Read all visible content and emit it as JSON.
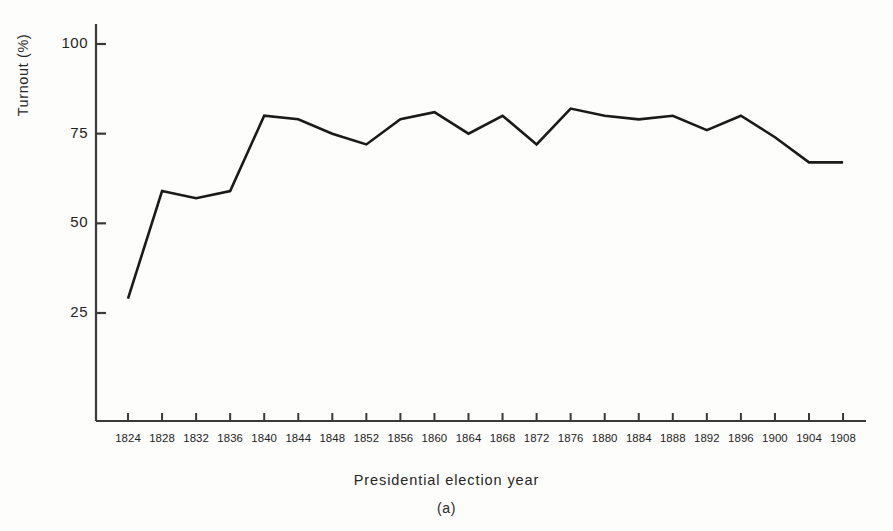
{
  "figure": {
    "caption": "(a)",
    "background_color": "#fdfdfc",
    "line_color": "#1a1a1a",
    "axis_color": "#3a3a3a"
  },
  "chart_data": {
    "type": "line",
    "title": "",
    "subtitle": "",
    "xlabel": "Presidential election year",
    "ylabel": "Turnout (%)",
    "categories": [
      "1824",
      "1828",
      "1832",
      "1836",
      "1840",
      "1844",
      "1848",
      "1852",
      "1856",
      "1860",
      "1864",
      "1868",
      "1872",
      "1876",
      "1880",
      "1884",
      "1888",
      "1892",
      "1896",
      "1900",
      "1904",
      "1908"
    ],
    "values": [
      29,
      59,
      57,
      59,
      80,
      79,
      75,
      72,
      79,
      81,
      75,
      80,
      72,
      82,
      80,
      79,
      80,
      76,
      80,
      74,
      67,
      67
    ],
    "series": [
      {
        "name": "Turnout",
        "values": [
          29,
          59,
          57,
          59,
          80,
          79,
          75,
          72,
          79,
          81,
          75,
          80,
          72,
          82,
          80,
          79,
          80,
          76,
          80,
          74,
          67,
          67
        ]
      }
    ],
    "yticks": [
      25,
      50,
      75,
      100
    ],
    "ytick_labels": [
      "25",
      "50",
      "75",
      "100"
    ],
    "ylim": [
      0,
      108
    ],
    "xlim_index": [
      -0.45,
      21.6
    ],
    "grid": false,
    "legend": null,
    "legend_position": "none"
  }
}
